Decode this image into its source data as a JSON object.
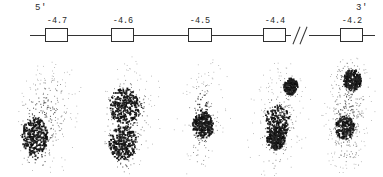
{
  "figure": {
    "type": "gene-map-with-autoradiograph-panels",
    "width": 383,
    "height": 177,
    "background": "#ffffff",
    "ink_color": "#2e2e2e"
  },
  "map": {
    "five_prime_label": "5'",
    "three_prime_label": "3'",
    "axis": {
      "y": 35,
      "segments": [
        {
          "x1": 30,
          "x2": 291
        },
        {
          "x1": 309,
          "x2": 375
        }
      ],
      "color": "#333333"
    },
    "break_symbol": {
      "name": "double-slash-break",
      "glyph": "//",
      "x": 291,
      "width": 18
    },
    "sites": [
      {
        "label": "-4.7",
        "x": 45,
        "width": 23,
        "label_x": 39,
        "label_width": 36
      },
      {
        "label": "-4.6",
        "x": 111,
        "width": 23,
        "label_x": 105,
        "label_width": 36
      },
      {
        "label": "-4.5",
        "x": 188,
        "width": 24,
        "label_x": 182,
        "label_width": 36
      },
      {
        "label": "-4.4",
        "x": 263,
        "width": 23,
        "label_x": 257,
        "label_width": 36
      },
      {
        "label": "-4.2",
        "x": 340,
        "width": 23,
        "label_x": 334,
        "label_width": 36
      }
    ]
  },
  "chart_data": {
    "type": "scatter",
    "title": "",
    "xlabel": "",
    "ylabel": "",
    "panels": [
      {
        "name": "panel-4-7",
        "site": "-4.7",
        "x": 14,
        "width": 78,
        "n_dots": 1500,
        "seed": 1307,
        "blobs": [
          {
            "cx": 0.44,
            "cy": 0.22,
            "rx": 0.4,
            "ry": 0.16,
            "density": 0.3,
            "dark": 0.05
          },
          {
            "cx": 0.33,
            "cy": 0.45,
            "rx": 0.26,
            "ry": 0.2,
            "density": 0.55,
            "dark": 0.25
          },
          {
            "cx": 0.26,
            "cy": 0.67,
            "rx": 0.18,
            "ry": 0.16,
            "density": 1.0,
            "dark": 0.92
          },
          {
            "cx": 0.3,
            "cy": 0.84,
            "rx": 0.15,
            "ry": 0.12,
            "density": 0.6,
            "dark": 0.45
          },
          {
            "cx": 0.55,
            "cy": 0.5,
            "rx": 0.22,
            "ry": 0.28,
            "density": 0.3,
            "dark": 0.08
          }
        ]
      },
      {
        "name": "panel-4-6",
        "site": "-4.6",
        "x": 96,
        "width": 72,
        "n_dots": 1450,
        "seed": 4621,
        "blobs": [
          {
            "cx": 0.48,
            "cy": 0.18,
            "rx": 0.36,
            "ry": 0.15,
            "density": 0.28,
            "dark": 0.04
          },
          {
            "cx": 0.38,
            "cy": 0.42,
            "rx": 0.22,
            "ry": 0.15,
            "density": 0.95,
            "dark": 0.8
          },
          {
            "cx": 0.55,
            "cy": 0.47,
            "rx": 0.16,
            "ry": 0.11,
            "density": 0.55,
            "dark": 0.35
          },
          {
            "cx": 0.36,
            "cy": 0.72,
            "rx": 0.2,
            "ry": 0.15,
            "density": 1.0,
            "dark": 0.9
          },
          {
            "cx": 0.4,
            "cy": 0.88,
            "rx": 0.14,
            "ry": 0.1,
            "density": 0.5,
            "dark": 0.3
          },
          {
            "cx": 0.58,
            "cy": 0.6,
            "rx": 0.2,
            "ry": 0.25,
            "density": 0.28,
            "dark": 0.06
          }
        ]
      },
      {
        "name": "panel-4-5",
        "site": "-4.5",
        "x": 172,
        "width": 66,
        "n_dots": 1250,
        "seed": 9044,
        "blobs": [
          {
            "cx": 0.58,
            "cy": 0.22,
            "rx": 0.28,
            "ry": 0.17,
            "density": 0.24,
            "dark": 0.03
          },
          {
            "cx": 0.44,
            "cy": 0.42,
            "rx": 0.16,
            "ry": 0.12,
            "density": 0.7,
            "dark": 0.45
          },
          {
            "cx": 0.46,
            "cy": 0.58,
            "rx": 0.17,
            "ry": 0.11,
            "density": 1.0,
            "dark": 0.88
          },
          {
            "cx": 0.42,
            "cy": 0.8,
            "rx": 0.14,
            "ry": 0.13,
            "density": 0.45,
            "dark": 0.22
          },
          {
            "cx": 0.52,
            "cy": 0.5,
            "rx": 0.22,
            "ry": 0.32,
            "density": 0.25,
            "dark": 0.05
          }
        ]
      },
      {
        "name": "panel-4-4",
        "site": "-4.4",
        "x": 244,
        "width": 74,
        "n_dots": 1450,
        "seed": 2288,
        "blobs": [
          {
            "cx": 0.55,
            "cy": 0.2,
            "rx": 0.32,
            "ry": 0.16,
            "density": 0.3,
            "dark": 0.04
          },
          {
            "cx": 0.62,
            "cy": 0.27,
            "rx": 0.1,
            "ry": 0.07,
            "density": 0.85,
            "dark": 0.65
          },
          {
            "cx": 0.44,
            "cy": 0.55,
            "rx": 0.18,
            "ry": 0.14,
            "density": 0.8,
            "dark": 0.55
          },
          {
            "cx": 0.42,
            "cy": 0.68,
            "rx": 0.13,
            "ry": 0.1,
            "density": 0.95,
            "dark": 0.78
          },
          {
            "cx": 0.4,
            "cy": 0.86,
            "rx": 0.16,
            "ry": 0.12,
            "density": 0.45,
            "dark": 0.18
          },
          {
            "cx": 0.55,
            "cy": 0.5,
            "rx": 0.26,
            "ry": 0.32,
            "density": 0.32,
            "dark": 0.07
          }
        ]
      },
      {
        "name": "panel-4-2",
        "site": "-4.2",
        "x": 318,
        "width": 62,
        "n_dots": 1600,
        "seed": 7711,
        "blobs": [
          {
            "cx": 0.5,
            "cy": 0.16,
            "rx": 0.32,
            "ry": 0.13,
            "density": 0.55,
            "dark": 0.22
          },
          {
            "cx": 0.54,
            "cy": 0.22,
            "rx": 0.15,
            "ry": 0.09,
            "density": 0.95,
            "dark": 0.8
          },
          {
            "cx": 0.46,
            "cy": 0.45,
            "rx": 0.3,
            "ry": 0.16,
            "density": 0.5,
            "dark": 0.18
          },
          {
            "cx": 0.42,
            "cy": 0.6,
            "rx": 0.16,
            "ry": 0.1,
            "density": 0.85,
            "dark": 0.6
          },
          {
            "cx": 0.46,
            "cy": 0.8,
            "rx": 0.26,
            "ry": 0.16,
            "density": 0.4,
            "dark": 0.1
          },
          {
            "cx": 0.5,
            "cy": 0.5,
            "rx": 0.34,
            "ry": 0.42,
            "density": 0.4,
            "dark": 0.08
          }
        ]
      }
    ]
  }
}
